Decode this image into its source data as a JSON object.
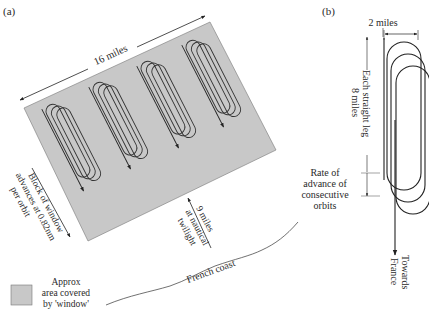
{
  "panel_a": {
    "label": "(a)",
    "width_label": "16 miles",
    "advance_label": [
      "Block of window",
      "advances at 0.82nm",
      "per orbit"
    ],
    "distance_label": [
      "9 miles",
      "at nautical",
      "twilight"
    ],
    "coast_label": "French coast",
    "legend": [
      "Approx",
      "area covered",
      "by 'window'"
    ],
    "area_color": "#c8c8c8"
  },
  "panel_b": {
    "label": "(b)",
    "width_label": "2 miles",
    "leg_label": [
      "Each straight leg",
      "8 miles"
    ],
    "rate_label": [
      "Rate of",
      "advance of",
      "consecutive",
      "orbits"
    ],
    "direction_label": [
      "Towards",
      "France"
    ]
  }
}
